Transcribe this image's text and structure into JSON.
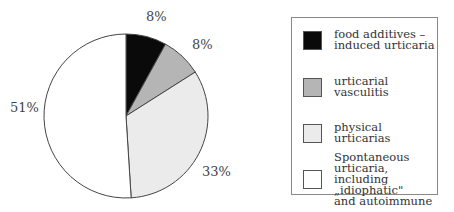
{
  "chart_data": {
    "type": "pie",
    "title": "",
    "categories": [
      "food additives – induced urticaria",
      "urticarial vasculitis",
      "physical urticarias",
      "Spontaneous urticaria, including „idiophatic\" and autoimmune"
    ],
    "values": [
      8,
      8,
      33,
      51
    ],
    "labels": [
      "8%",
      "8%",
      "33%",
      "51%"
    ],
    "colors": [
      "#0a0a0a",
      "#b5b5b5",
      "#ebebeb",
      "#ffffff"
    ],
    "start_angle": "12 o'clock, clockwise",
    "legend_position": "right"
  },
  "legend": {
    "items": [
      {
        "line1": "food additives –",
        "line2": "induced urticaria",
        "color": "#0a0a0a"
      },
      {
        "line1": "urticarial vasculitis",
        "color": "#b5b5b5"
      },
      {
        "line1": "physical urticarias",
        "color": "#ebebeb"
      },
      {
        "line1": "Spontaneous urticaria,",
        "line2": "including „idiophatic\"",
        "line3": "and autoimmune",
        "color": "#ffffff"
      }
    ]
  }
}
